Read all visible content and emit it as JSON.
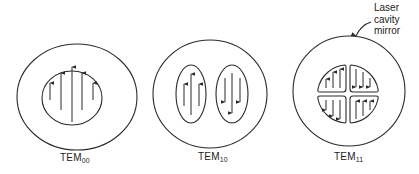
{
  "diagram": {
    "modes": [
      {
        "id": "tem00",
        "label_main": "TEM",
        "label_sub": "00",
        "lobes": 1
      },
      {
        "id": "tem10",
        "label_main": "TEM",
        "label_sub": "10",
        "lobes": 2
      },
      {
        "id": "tem11",
        "label_main": "TEM",
        "label_sub": "11",
        "lobes": 4
      }
    ],
    "annotation": {
      "line1": "Laser",
      "line2": "cavity",
      "line3": "mirror",
      "points_to": "outer circle of TEM11"
    },
    "colors": {
      "stroke": "#2a2a2a",
      "background": "#ffffff"
    }
  }
}
